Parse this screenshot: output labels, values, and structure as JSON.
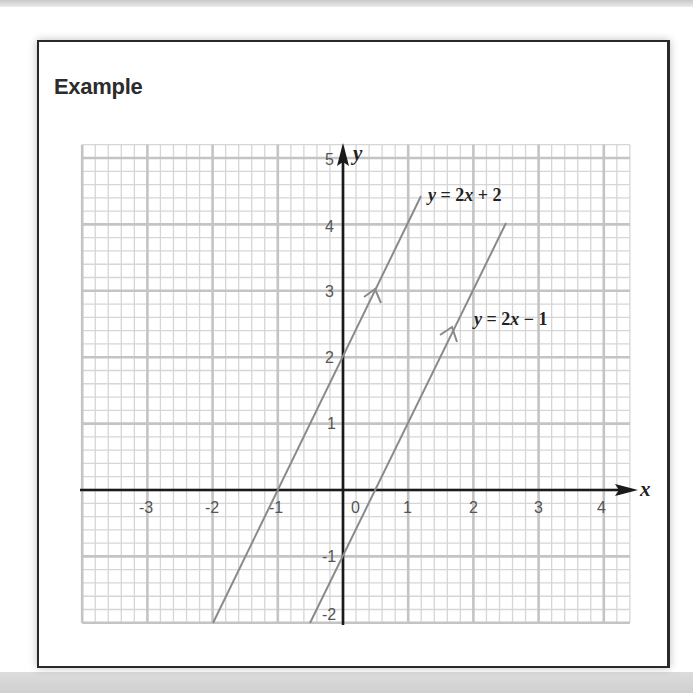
{
  "card": {
    "title": "Example"
  },
  "chart_data": {
    "type": "line",
    "title": "Example",
    "xlabel": "x",
    "ylabel": "y",
    "xlim": [
      -4,
      4.4
    ],
    "ylim": [
      -2,
      5.2
    ],
    "grid": true,
    "minor_grid_step": 0.2,
    "x_ticks": [
      "-3",
      "-2",
      "-1",
      "0",
      "1",
      "2",
      "3",
      "4"
    ],
    "y_ticks": [
      "-2",
      "-1",
      "1",
      "2",
      "3",
      "4",
      "5"
    ],
    "series": [
      {
        "name": "y = 2x + 2",
        "slope": 2,
        "intercept": 2,
        "x": [
          -2,
          1.2
        ],
        "y": [
          -2,
          4.4
        ],
        "arrow_at": [
          0.5,
          3
        ]
      },
      {
        "name": "y = 2x − 1",
        "slope": 2,
        "intercept": -1,
        "x": [
          -0.5,
          2.5
        ],
        "y": [
          -2,
          4
        ],
        "arrow_at": [
          1.7,
          2.4
        ]
      }
    ],
    "labels": [
      {
        "text": "y = 2x + 2",
        "x": 1.3,
        "y": 4.4
      },
      {
        "text": "y = 2x − 1",
        "x": 2.0,
        "y": 2.5
      }
    ],
    "colors": {
      "major_grid": "#c4c4c4",
      "minor_grid": "#d6d6d6",
      "axes": "#1a1a1a",
      "lines": "#8a8a8a"
    }
  },
  "labels": {
    "x_axis": "x",
    "y_axis": "y",
    "line1": {
      "y": "y",
      "eq": " = 2",
      "x": "x",
      "rest": " + 2"
    },
    "line2": {
      "y": "y",
      "eq": " = 2",
      "x": "x",
      "rest": " − 1"
    },
    "x_ticks": [
      "-3",
      "-2",
      "-1",
      "0",
      "1",
      "2",
      "3",
      "4"
    ],
    "y_ticks": [
      "5",
      "4",
      "3",
      "2",
      "1",
      "-1",
      "-2"
    ]
  }
}
